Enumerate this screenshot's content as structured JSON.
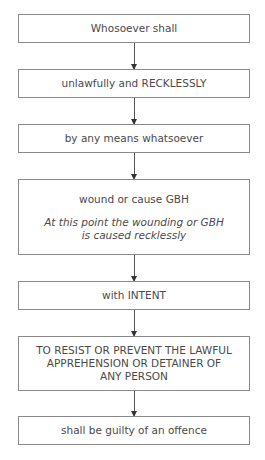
{
  "flowchart": {
    "steps": [
      {
        "text": "Whosoever shall"
      },
      {
        "text": "unlawfully and RECKLESSLY"
      },
      {
        "text": "by any means whatsoever"
      },
      {
        "text": "wound or cause GBH",
        "note": "At this point the wounding or GBH is caused recklessly"
      },
      {
        "text": "with INTENT"
      },
      {
        "text": "TO RESIST OR PREVENT THE LAWFUL APPREHENSION OR DETAINER OF ANY PERSON"
      },
      {
        "text": "shall be guilty of an offence"
      }
    ],
    "colors": {
      "border": "#8a8a8a",
      "text": "#4a4a4a",
      "arrow": "#333333"
    }
  }
}
